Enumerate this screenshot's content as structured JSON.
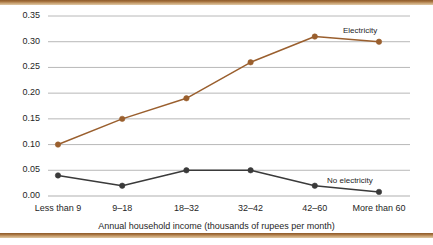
{
  "chart_data": {
    "type": "line",
    "title": "",
    "xlabel": "Annual household income (thousands of rupees per month)",
    "ylabel": "",
    "categories": [
      "Less than 9",
      "9–18",
      "18–32",
      "32–42",
      "42–60",
      "More than 60"
    ],
    "series": [
      {
        "name": "Electricity",
        "color": "#9a5f2e",
        "values": [
          0.1,
          0.15,
          0.19,
          0.26,
          0.31,
          0.3
        ]
      },
      {
        "name": "No electricity",
        "color": "#3a3a3a",
        "values": [
          0.04,
          0.02,
          0.05,
          0.05,
          0.02,
          0.008
        ]
      }
    ],
    "ylim": [
      0.0,
      0.35
    ],
    "ytick_labels": [
      "0.00",
      "0.05",
      "0.10",
      "0.15",
      "0.20",
      "0.25",
      "0.30",
      "0.35"
    ],
    "ytick_values": [
      0.0,
      0.05,
      0.1,
      0.15,
      0.2,
      0.25,
      0.3,
      0.35
    ],
    "grid": true,
    "grid_color": "#b0b0b0",
    "legend_position": "inline-annotations",
    "annotations": [
      {
        "text": "Electricity",
        "series": "Electricity"
      },
      {
        "text": "No electricity",
        "series": "No electricity"
      }
    ],
    "frame": {
      "top_bar_color": "#8d5a2b",
      "bottom_bar_color": "#8d5a2b"
    }
  }
}
